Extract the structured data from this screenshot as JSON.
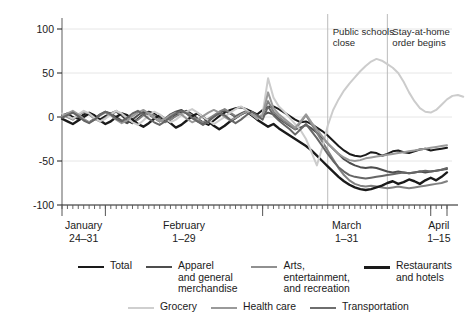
{
  "chart_data": {
    "type": "line",
    "title": "",
    "xlabel": "",
    "ylabel": "Percentage change from January 2020",
    "ylim": [
      -100,
      100
    ],
    "yticks": [
      100,
      50,
      0,
      -50,
      -100
    ],
    "ytick_labels": [
      "100",
      "50",
      "0",
      "-50",
      "-100"
    ],
    "grid": true,
    "legend_position": "bottom",
    "x_axis": {
      "tick_groups": [
        {
          "label_line1": "January",
          "label_line2": "24–31"
        },
        {
          "label_line1": "February",
          "label_line2": "1–29"
        },
        {
          "label_line1": "March",
          "label_line2": "1–31"
        },
        {
          "label_line1": "April",
          "label_line2": "1–15"
        }
      ],
      "minor_ticks": "daily"
    },
    "annotations": [
      {
        "text": "Public schools\nclose",
        "x_index": 49
      },
      {
        "text": "Stay-at-home\norder begins",
        "x_index": 60
      }
    ],
    "series": [
      {
        "name": "Total",
        "color": "#1a1a1a",
        "width": 2.0,
        "values": [
          2,
          4,
          0,
          -2,
          3,
          5,
          2,
          -3,
          1,
          4,
          6,
          2,
          -4,
          -7,
          -2,
          3,
          6,
          4,
          -1,
          -5,
          -3,
          2,
          5,
          7,
          3,
          -2,
          -6,
          -9,
          -4,
          1,
          5,
          8,
          10,
          11,
          9,
          6,
          3,
          8,
          11,
          12,
          9,
          5,
          1,
          -3,
          -6,
          -5,
          -8,
          -12,
          -16,
          -21,
          -27,
          -33,
          -38,
          -42,
          -44,
          -45,
          -43,
          -40,
          -41,
          -44,
          -42,
          -39,
          -38,
          -40,
          -41,
          -39,
          -37,
          -36,
          -38,
          -37,
          -36,
          -35
        ]
      },
      {
        "name": "Apparel\nand general\nmerchandise",
        "color": "#4d4d4d",
        "width": 2.0,
        "values": [
          0,
          3,
          6,
          2,
          -3,
          -6,
          -2,
          3,
          6,
          4,
          0,
          -4,
          -7,
          -3,
          2,
          6,
          3,
          -1,
          -5,
          -2,
          3,
          6,
          8,
          4,
          -1,
          -5,
          -8,
          -4,
          1,
          5,
          7,
          4,
          0,
          3,
          6,
          2,
          -2,
          2,
          5,
          3,
          -2,
          -6,
          -10,
          -14,
          -12,
          -9,
          -13,
          -18,
          -24,
          -30,
          -36,
          -42,
          -48,
          -52,
          -55,
          -57,
          -58,
          -57,
          -58,
          -60,
          -62,
          -63,
          -62,
          -63,
          -64,
          -63,
          -62,
          -63,
          -62,
          -61,
          -60,
          -59
        ]
      },
      {
        "name": "Arts,\nentertainment,\nand recreation",
        "color": "#808080",
        "width": 2.0,
        "values": [
          3,
          0,
          -3,
          2,
          6,
          3,
          -2,
          -5,
          -1,
          4,
          7,
          3,
          -2,
          -6,
          -3,
          2,
          5,
          2,
          -2,
          -6,
          -3,
          1,
          4,
          6,
          2,
          -3,
          -6,
          -2,
          2,
          6,
          9,
          5,
          1,
          4,
          7,
          3,
          -1,
          3,
          18,
          6,
          0,
          -5,
          -9,
          -14,
          -6,
          2,
          -8,
          -18,
          -28,
          -38,
          -48,
          -58,
          -66,
          -72,
          -76,
          -78,
          -79,
          -78,
          -79,
          -80,
          -81,
          -80,
          -79,
          -80,
          -81,
          -80,
          -79,
          -78,
          -77,
          -76,
          -75,
          -73
        ]
      },
      {
        "name": "Restaurants\nand hotels",
        "color": "#1a1a1a",
        "width": 2.4,
        "values": [
          -2,
          -5,
          -8,
          -4,
          0,
          4,
          1,
          -4,
          -8,
          -5,
          0,
          4,
          2,
          -3,
          -8,
          -11,
          -7,
          -2,
          2,
          -2,
          -7,
          -12,
          -9,
          -4,
          1,
          4,
          0,
          -5,
          -10,
          -14,
          -10,
          -5,
          -1,
          3,
          6,
          2,
          -3,
          -7,
          -11,
          -8,
          -13,
          -17,
          -21,
          -25,
          -29,
          -33,
          -38,
          -44,
          -50,
          -56,
          -62,
          -68,
          -73,
          -77,
          -80,
          -82,
          -83,
          -82,
          -80,
          -78,
          -75,
          -73,
          -76,
          -74,
          -71,
          -73,
          -76,
          -72,
          -69,
          -72,
          -68,
          -63
        ]
      },
      {
        "name": "Grocery",
        "color": "#cccccc",
        "width": 2.0,
        "values": [
          4,
          1,
          -2,
          3,
          7,
          4,
          -1,
          -5,
          -2,
          3,
          7,
          4,
          -1,
          -6,
          -9,
          -4,
          2,
          6,
          3,
          -2,
          -6,
          -3,
          2,
          6,
          9,
          5,
          0,
          -4,
          -8,
          -4,
          0,
          5,
          9,
          12,
          8,
          3,
          -2,
          4,
          44,
          22,
          12,
          6,
          -1,
          -8,
          -15,
          -25,
          -40,
          -55,
          -35,
          -10,
          8,
          20,
          30,
          38,
          45,
          52,
          58,
          63,
          66,
          64,
          60,
          56,
          50,
          40,
          28,
          18,
          10,
          6,
          5,
          8,
          14,
          20,
          24,
          25,
          23
        ]
      },
      {
        "name": "Health care",
        "color": "#999999",
        "width": 2.0,
        "values": [
          1,
          4,
          7,
          3,
          -2,
          -6,
          -3,
          2,
          5,
          2,
          -3,
          -7,
          -4,
          1,
          5,
          8,
          4,
          -1,
          -5,
          -2,
          2,
          5,
          3,
          -2,
          -6,
          -3,
          1,
          5,
          8,
          5,
          0,
          -4,
          -1,
          3,
          6,
          3,
          -1,
          2,
          28,
          10,
          3,
          -2,
          -7,
          -12,
          -5,
          3,
          -6,
          -14,
          -22,
          -30,
          -36,
          -42,
          -46,
          -49,
          -50,
          -49,
          -47,
          -46,
          -45,
          -44,
          -43,
          -42,
          -41,
          -40,
          -39,
          -38,
          -37,
          -36,
          -35,
          -34,
          -33,
          -32
        ]
      },
      {
        "name": "Transportation",
        "color": "#666666",
        "width": 2.0,
        "values": [
          -1,
          2,
          5,
          1,
          -4,
          -7,
          -3,
          2,
          6,
          3,
          -2,
          -5,
          -1,
          4,
          7,
          3,
          -2,
          -6,
          -9,
          -5,
          0,
          4,
          7,
          4,
          -1,
          -5,
          -9,
          -5,
          0,
          4,
          2,
          -3,
          -7,
          -3,
          2,
          6,
          2,
          -3,
          12,
          2,
          -4,
          -9,
          -14,
          -20,
          -14,
          -8,
          -16,
          -24,
          -33,
          -42,
          -50,
          -57,
          -62,
          -66,
          -68,
          -69,
          -70,
          -69,
          -68,
          -67,
          -66,
          -65,
          -64,
          -63,
          -64,
          -63,
          -62,
          -61,
          -62,
          -61,
          -60,
          -58
        ]
      }
    ]
  },
  "legend": {
    "row1": [
      {
        "label": "Total",
        "color": "#1a1a1a",
        "width": 2.6
      },
      {
        "label": "Apparel\nand general\nmerchandise",
        "color": "#4d4d4d",
        "width": 2.6
      },
      {
        "label": "Arts,\nentertainment,\nand recreation",
        "color": "#909090",
        "width": 2.2
      },
      {
        "label": "Restaurants\nand hotels",
        "color": "#1a1a1a",
        "width": 3.0
      }
    ],
    "row2": [
      {
        "label": "Grocery",
        "color": "#cfcfcf",
        "width": 2.2
      },
      {
        "label": "Health care",
        "color": "#9a9a9a",
        "width": 2.2
      },
      {
        "label": "Transportation",
        "color": "#6e6e6e",
        "width": 2.2
      }
    ]
  }
}
